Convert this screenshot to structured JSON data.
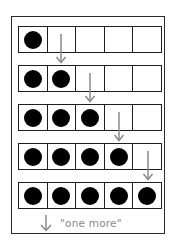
{
  "diagram": {
    "title": "",
    "rows": [
      {
        "filled": 1,
        "total": 5
      },
      {
        "filled": 2,
        "total": 5
      },
      {
        "filled": 3,
        "total": 5
      },
      {
        "filled": 4,
        "total": 5
      },
      {
        "filled": 5,
        "total": 5
      }
    ],
    "legend": {
      "icon": "down-arrow-icon",
      "label": "\"one more\""
    },
    "colors": {
      "dot": "#000000",
      "grid": "#1e1e1e",
      "arrow": "#8a8a8a",
      "frame": "#2a2a2a"
    }
  }
}
